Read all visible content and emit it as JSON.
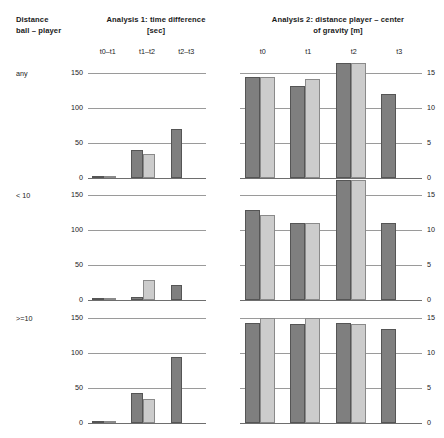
{
  "header": {
    "left_title_line1": "Distance",
    "left_title_line2": "ball – player",
    "analysis1_title_line1": "Analysis 1: time difference",
    "analysis1_title_line2": "[sec]",
    "analysis2_title_line1": "Analysis 2: distance player – center",
    "analysis2_title_line2": "of gravity [m]"
  },
  "row_labels": [
    "any",
    "< 10",
    ">=10"
  ],
  "chart_data": [
    {
      "type": "bar",
      "title": "Analysis 1: time difference [sec]",
      "panel": "analysis1",
      "row": "any",
      "xlabel": "",
      "ylabel": "[sec]",
      "categories": [
        "t0–t1",
        "t1–t2",
        "t2–t3"
      ],
      "yticks": [
        0,
        50,
        100,
        150
      ],
      "ylim": [
        0,
        155
      ],
      "grid": true,
      "legend": "none",
      "series": [
        {
          "name": "dark",
          "values": [
            2,
            40,
            70
          ]
        },
        {
          "name": "light",
          "values": [
            1,
            35,
            null
          ]
        }
      ]
    },
    {
      "type": "bar",
      "title": "Analysis 1: time difference [sec]",
      "panel": "analysis1",
      "row": "< 10",
      "xlabel": "",
      "ylabel": "[sec]",
      "categories": [
        "t0–t1",
        "t1–t2",
        "t2–t3"
      ],
      "yticks": [
        0,
        50,
        100,
        150
      ],
      "ylim": [
        0,
        155
      ],
      "grid": true,
      "legend": "none",
      "series": [
        {
          "name": "dark",
          "values": [
            3,
            4,
            22
          ]
        },
        {
          "name": "light",
          "values": [
            1,
            28,
            null
          ]
        }
      ]
    },
    {
      "type": "bar",
      "title": "Analysis 1: time difference [sec]",
      "panel": "analysis1",
      "row": ">=10",
      "xlabel": "",
      "ylabel": "[sec]",
      "categories": [
        "t0–t1",
        "t1–t2",
        "t2–t3"
      ],
      "yticks": [
        0,
        50,
        100,
        150
      ],
      "ylim": [
        0,
        155
      ],
      "grid": true,
      "legend": "none",
      "series": [
        {
          "name": "dark",
          "values": [
            2,
            43,
            95
          ]
        },
        {
          "name": "light",
          "values": [
            1,
            35,
            null
          ]
        }
      ]
    },
    {
      "type": "bar",
      "title": "Analysis 2: distance player – center of gravity [m]",
      "panel": "analysis2",
      "row": "any",
      "xlabel": "",
      "ylabel": "[m]",
      "categories": [
        "t0",
        "t1",
        "t2",
        "t3"
      ],
      "yticks": [
        0,
        5,
        10,
        15
      ],
      "ylim": [
        0,
        15
      ],
      "grid": true,
      "legend": "none",
      "series": [
        {
          "name": "dark",
          "values": [
            14.5,
            13.2,
            16.5,
            12.0
          ]
        },
        {
          "name": "light",
          "values": [
            14.5,
            14.1,
            16.5,
            null
          ]
        }
      ]
    },
    {
      "title": "Analysis 2: distance player – center of gravity [m]",
      "type": "bar",
      "panel": "analysis2",
      "row": "< 10",
      "xlabel": "",
      "ylabel": "[m]",
      "categories": [
        "t0",
        "t1",
        "t2",
        "t3"
      ],
      "yticks": [
        0,
        5,
        10,
        15
      ],
      "ylim": [
        0,
        15
      ],
      "grid": true,
      "legend": "none",
      "series": [
        {
          "name": "dark",
          "values": [
            12.9,
            11.0,
            17.2,
            11.0
          ]
        },
        {
          "name": "light",
          "values": [
            12.2,
            11.0,
            17.2,
            null
          ]
        }
      ]
    },
    {
      "type": "bar",
      "title": "Analysis 2: distance player – center of gravity [m]",
      "panel": "analysis2",
      "row": ">=10",
      "xlabel": "",
      "ylabel": "[m]",
      "categories": [
        "t0",
        "t1",
        "t2",
        "t3"
      ],
      "yticks": [
        0,
        5,
        10,
        15
      ],
      "ylim": [
        0,
        15
      ],
      "grid": true,
      "legend": "none",
      "series": [
        {
          "name": "dark",
          "values": [
            14.3,
            14.2,
            14.3,
            13.5
          ]
        },
        {
          "name": "light",
          "values": [
            15.0,
            15.0,
            14.2,
            null
          ]
        }
      ]
    }
  ],
  "colors": {
    "bar_dark": "#7f7f7f",
    "bar_light": "#cccccc",
    "gridline": "#9a9a9a",
    "text": "#1a1a1a",
    "background": "#ffffff"
  }
}
